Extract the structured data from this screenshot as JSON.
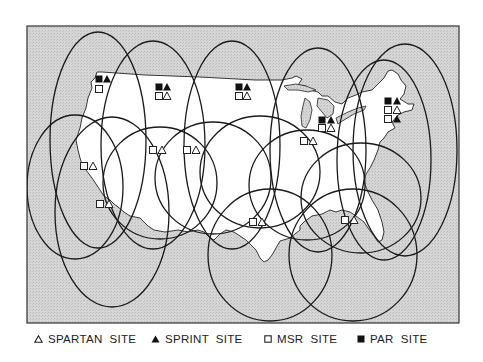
{
  "figure": {
    "frame": {
      "x": 27,
      "y": 26,
      "width": 432,
      "height": 297
    },
    "colors": {
      "water": "#cfcfcf",
      "land": "#ffffff",
      "ink": "#1a1a1a"
    }
  },
  "legend": [
    {
      "symbol": "spartan",
      "icon": "open-triangle-icon",
      "label": "SPARTAN  SITE"
    },
    {
      "symbol": "sprint",
      "icon": "filled-triangle-icon",
      "label": "SPRINT  SITE"
    },
    {
      "symbol": "msr",
      "icon": "open-square-icon",
      "label": "MSR  SITE"
    },
    {
      "symbol": "par",
      "icon": "filled-square-icon",
      "label": "PAR  SITE"
    }
  ],
  "sites": [
    {
      "region": "northwest",
      "symbols": [
        {
          "t": "par",
          "x": 99,
          "y": 79
        },
        {
          "t": "sprint",
          "x": 107,
          "y": 79
        },
        {
          "t": "msr",
          "x": 99,
          "y": 89
        }
      ]
    },
    {
      "region": "montana",
      "symbols": [
        {
          "t": "par",
          "x": 159,
          "y": 87
        },
        {
          "t": "sprint",
          "x": 167,
          "y": 87
        },
        {
          "t": "msr",
          "x": 159,
          "y": 96
        },
        {
          "t": "spartan",
          "x": 167,
          "y": 96
        }
      ]
    },
    {
      "region": "dakota",
      "symbols": [
        {
          "t": "par",
          "x": 239,
          "y": 87
        },
        {
          "t": "sprint",
          "x": 247,
          "y": 87
        },
        {
          "t": "msr",
          "x": 239,
          "y": 96
        },
        {
          "t": "spartan",
          "x": 247,
          "y": 96
        }
      ]
    },
    {
      "region": "michigan",
      "symbols": [
        {
          "t": "par",
          "x": 322,
          "y": 120
        },
        {
          "t": "sprint",
          "x": 331,
          "y": 120
        },
        {
          "t": "msr",
          "x": 322,
          "y": 128
        },
        {
          "t": "spartan",
          "x": 331,
          "y": 128
        }
      ]
    },
    {
      "region": "northeast",
      "symbols": [
        {
          "t": "par",
          "x": 388,
          "y": 101
        },
        {
          "t": "sprint",
          "x": 397,
          "y": 101
        },
        {
          "t": "msr",
          "x": 388,
          "y": 110
        },
        {
          "t": "spartan",
          "x": 397,
          "y": 110
        },
        {
          "t": "msr",
          "x": 388,
          "y": 119
        },
        {
          "t": "sprint",
          "x": 397,
          "y": 119
        }
      ]
    },
    {
      "region": "ohio-valley",
      "symbols": [
        {
          "t": "msr",
          "x": 304,
          "y": 141
        },
        {
          "t": "spartan",
          "x": 313,
          "y": 141
        }
      ]
    },
    {
      "region": "great-basin",
      "symbols": [
        {
          "t": "msr",
          "x": 153,
          "y": 150
        },
        {
          "t": "spartan",
          "x": 162,
          "y": 150
        }
      ]
    },
    {
      "region": "rockies",
      "symbols": [
        {
          "t": "msr",
          "x": 187,
          "y": 150
        },
        {
          "t": "spartan",
          "x": 196,
          "y": 150
        }
      ]
    },
    {
      "region": "north-california",
      "symbols": [
        {
          "t": "msr",
          "x": 84,
          "y": 166
        },
        {
          "t": "spartan",
          "x": 93,
          "y": 166
        }
      ]
    },
    {
      "region": "south-california",
      "symbols": [
        {
          "t": "msr",
          "x": 100,
          "y": 204
        },
        {
          "t": "spartan",
          "x": 109,
          "y": 204
        }
      ]
    },
    {
      "region": "texas",
      "symbols": [
        {
          "t": "msr",
          "x": 253,
          "y": 222
        },
        {
          "t": "spartan",
          "x": 262,
          "y": 222
        }
      ]
    },
    {
      "region": "southeast",
      "symbols": [
        {
          "t": "msr",
          "x": 345,
          "y": 220
        },
        {
          "t": "spartan",
          "x": 354,
          "y": 220
        }
      ]
    }
  ],
  "coverage_ellipses": [
    {
      "cx": 98,
      "cy": 140,
      "rx": 48,
      "ry": 108
    },
    {
      "cx": 153,
      "cy": 145,
      "rx": 52,
      "ry": 104
    },
    {
      "cx": 232,
      "cy": 145,
      "rx": 48,
      "ry": 104
    },
    {
      "cx": 318,
      "cy": 150,
      "rx": 48,
      "ry": 102
    },
    {
      "cx": 405,
      "cy": 150,
      "rx": 52,
      "ry": 106
    },
    {
      "cx": 384,
      "cy": 160,
      "rx": 47,
      "ry": 100
    },
    {
      "cx": 75,
      "cy": 187,
      "rx": 48,
      "ry": 72
    },
    {
      "cx": 112,
      "cy": 212,
      "rx": 57,
      "ry": 95
    },
    {
      "cx": 160,
      "cy": 183,
      "rx": 57,
      "ry": 56
    },
    {
      "cx": 213,
      "cy": 178,
      "rx": 58,
      "ry": 56
    },
    {
      "cx": 260,
      "cy": 172,
      "rx": 60,
      "ry": 56
    },
    {
      "cx": 307,
      "cy": 185,
      "rx": 58,
      "ry": 55
    },
    {
      "cx": 361,
      "cy": 198,
      "rx": 60,
      "ry": 55
    },
    {
      "cx": 270,
      "cy": 255,
      "rx": 62,
      "ry": 66
    },
    {
      "cx": 353,
      "cy": 255,
      "rx": 64,
      "ry": 66
    }
  ]
}
